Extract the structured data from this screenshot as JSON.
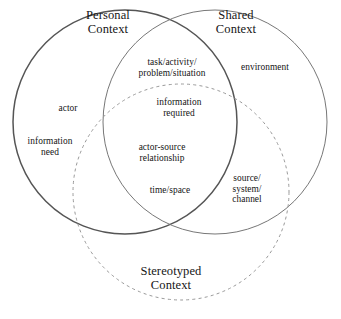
{
  "diagram": {
    "type": "venn",
    "background_color": "#ffffff",
    "text_color": "#151515",
    "circles": [
      {
        "id": "personal-context",
        "title": "Personal\nContext",
        "stroke_color": "#555555",
        "stroke_style": "solid",
        "cx": 125,
        "cy": 122,
        "r": 112
      },
      {
        "id": "shared-context",
        "title": "Shared\nContext",
        "stroke_color": "#777777",
        "stroke_style": "solid",
        "cx": 215,
        "cy": 122,
        "r": 112
      },
      {
        "id": "stereotyped-context",
        "title": "Stereotyped\nContext",
        "stroke_color": "#999999",
        "stroke_style": "dashed",
        "cx": 181,
        "cy": 192,
        "r": 108
      }
    ],
    "items": [
      {
        "id": "actor",
        "text": "actor",
        "region": "personal-only"
      },
      {
        "id": "information-need",
        "text": "information\nneed",
        "region": "personal-only"
      },
      {
        "id": "environment",
        "text": "environment",
        "region": "shared-only"
      },
      {
        "id": "task-activity",
        "text": "task/activity/\nproblem/situation",
        "region": "personal-shared"
      },
      {
        "id": "information-required",
        "text": "information\nrequired",
        "region": "personal-shared-stereotyped"
      },
      {
        "id": "actor-source",
        "text": "actor-source\nrelationship",
        "region": "personal-shared-stereotyped"
      },
      {
        "id": "time-space",
        "text": "time/space",
        "region": "personal-shared-stereotyped"
      },
      {
        "id": "source-system",
        "text": "source/\nsystem/\nchannel",
        "region": "shared-stereotyped"
      }
    ]
  }
}
